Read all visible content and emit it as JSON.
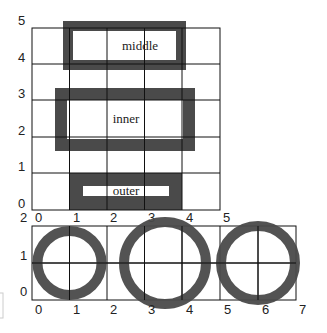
{
  "top_panel": {
    "y_ticks": [
      "5",
      "4",
      "3",
      "2",
      "1",
      "0"
    ],
    "x_ticks": [
      "0",
      "1",
      "2",
      "3",
      "4",
      "5"
    ],
    "boxes": [
      {
        "label": "middle"
      },
      {
        "label": "inner"
      },
      {
        "label": "outer"
      }
    ]
  },
  "bottom_panel": {
    "top_ticks": [
      "2",
      "0",
      "1",
      "2",
      "3",
      "4",
      "5"
    ],
    "y_ticks": [
      "1",
      "0"
    ],
    "x_ticks": [
      "0",
      "1",
      "2",
      "3",
      "4",
      "5",
      "6",
      "7"
    ]
  },
  "colors": {
    "stroke": "#4a4a4a",
    "grid": "#111111",
    "background": "#ffffff"
  }
}
